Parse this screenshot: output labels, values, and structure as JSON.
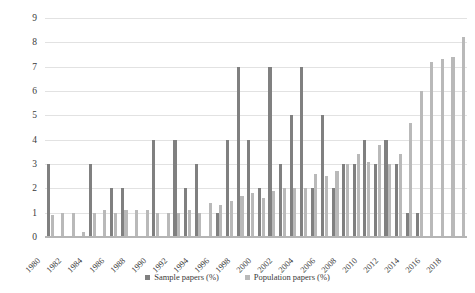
{
  "chart_data": {
    "type": "bar",
    "title": "",
    "xlabel": "",
    "ylabel": "No. Papers (%)",
    "ylim": [
      0,
      9
    ],
    "y_ticks": [
      0,
      1,
      2,
      3,
      4,
      5,
      6,
      7,
      8,
      9
    ],
    "grid": true,
    "legend_position": "bottom",
    "x": [
      1980,
      1981,
      1982,
      1983,
      1984,
      1985,
      1986,
      1987,
      1988,
      1989,
      1990,
      1991,
      1992,
      1993,
      1994,
      1995,
      1996,
      1997,
      1998,
      1999,
      2000,
      2001,
      2002,
      2003,
      2004,
      2005,
      2006,
      2007,
      2008,
      2009,
      2010,
      2011,
      2012,
      2013,
      2014,
      2015,
      2016,
      2017,
      2018,
      2019
    ],
    "categories": [
      "1980",
      "1981",
      "1982",
      "1983",
      "1984",
      "1985",
      "1986",
      "1987",
      "1988",
      "1989",
      "1990",
      "1991",
      "1992",
      "1993",
      "1994",
      "1995",
      "1996",
      "1997",
      "1998",
      "1999",
      "2000",
      "2001",
      "2002",
      "2003",
      "2004",
      "2005",
      "2006",
      "2007",
      "2008",
      "2009",
      "2010",
      "2011",
      "2012",
      "2013",
      "2014",
      "2015",
      "2016",
      "2017",
      "2018",
      "2019"
    ],
    "x_tick_labels": [
      "1980",
      "1982",
      "1984",
      "1986",
      "1988",
      "1990",
      "1992",
      "1994",
      "1996",
      "1998",
      "2000",
      "2002",
      "2004",
      "2006",
      "2008",
      "2010",
      "2012",
      "2014",
      "2016",
      "2018"
    ],
    "series": [
      {
        "name": "Sample papers (%)",
        "color": "#808080",
        "values": [
          3.0,
          0.0,
          0.0,
          0.0,
          3.0,
          0.0,
          2.0,
          2.0,
          0.0,
          0.0,
          4.0,
          0.0,
          4.0,
          2.0,
          3.0,
          0.0,
          1.0,
          4.0,
          7.0,
          4.0,
          2.0,
          7.0,
          3.0,
          5.0,
          7.0,
          2.0,
          5.0,
          2.0,
          3.0,
          3.0,
          4.0,
          3.0,
          4.0,
          3.0,
          1.0,
          1.0,
          0.0,
          0.0,
          0.0,
          0.0
        ]
      },
      {
        "name": "Population papers (%)",
        "color": "#b9b9b9",
        "values": [
          0.9,
          1.0,
          1.0,
          0.2,
          1.0,
          1.1,
          1.0,
          1.1,
          1.1,
          1.1,
          1.0,
          1.0,
          1.0,
          1.1,
          1.0,
          1.4,
          1.3,
          1.5,
          1.7,
          1.8,
          1.6,
          1.9,
          2.0,
          2.0,
          2.0,
          2.6,
          2.5,
          2.7,
          3.0,
          3.4,
          3.1,
          3.8,
          3.0,
          3.4,
          4.7,
          6.0,
          7.2,
          7.3,
          7.4,
          8.2
        ]
      }
    ]
  },
  "legend": {
    "items": [
      {
        "label": "Sample papers (%)",
        "color": "#808080"
      },
      {
        "label": "Population papers (%)",
        "color": "#b9b9b9"
      }
    ]
  },
  "axes": {
    "y_title": "No. Papers (%)"
  }
}
